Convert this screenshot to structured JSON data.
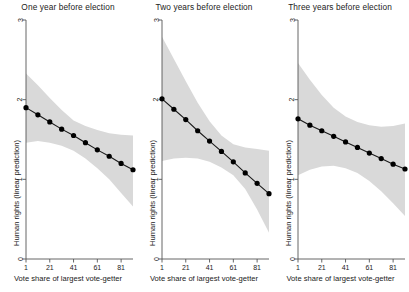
{
  "figure": {
    "background": "#ffffff",
    "axis_color": "#555555",
    "band_color": "#d9d9d9",
    "line_color": "#1a1a1a",
    "marker_color": "#000000"
  },
  "axes": {
    "y_label": "Human rights (linear prediction)",
    "x_label": "Vote share of largest vote-getter",
    "y_ticks": [
      "0",
      "1",
      "2",
      "3"
    ],
    "x_ticks": [
      "1",
      "21",
      "41",
      "61",
      "81"
    ]
  },
  "chart_data": [
    {
      "type": "line",
      "title": "One year before election",
      "xlabel": "Vote share of largest vote-getter",
      "ylabel": "Human rights (linear prediction)",
      "xlim": [
        1,
        91
      ],
      "ylim": [
        0,
        3
      ],
      "x_ticks": [
        1,
        21,
        41,
        61,
        81
      ],
      "y_ticks": [
        0,
        1,
        2,
        3
      ],
      "grid": false,
      "legend": "none",
      "x": [
        1,
        11,
        21,
        31,
        41,
        51,
        61,
        71,
        81,
        91
      ],
      "values": [
        1.9,
        1.81,
        1.72,
        1.63,
        1.55,
        1.46,
        1.37,
        1.29,
        1.2,
        1.12
      ],
      "ci_lower": [
        1.46,
        1.48,
        1.46,
        1.42,
        1.36,
        1.26,
        1.14,
        1.0,
        0.83,
        0.66
      ],
      "ci_upper": [
        2.33,
        2.18,
        2.02,
        1.87,
        1.74,
        1.67,
        1.62,
        1.58,
        1.56,
        1.55
      ],
      "marker": "filled-circle",
      "band_label": "95% confidence interval"
    },
    {
      "type": "line",
      "title": "Two years before election",
      "xlabel": "Vote share of largest vote-getter",
      "ylabel": "Human rights (linear prediction)",
      "xlim": [
        1,
        91
      ],
      "ylim": [
        0,
        3
      ],
      "x_ticks": [
        1,
        21,
        41,
        61,
        81
      ],
      "y_ticks": [
        0,
        1,
        2,
        3
      ],
      "grid": false,
      "legend": "none",
      "x": [
        1,
        11,
        21,
        31,
        41,
        51,
        61,
        71,
        81,
        91
      ],
      "values": [
        2.01,
        1.88,
        1.75,
        1.61,
        1.48,
        1.35,
        1.22,
        1.08,
        0.95,
        0.82
      ],
      "ci_lower": [
        1.23,
        1.26,
        1.27,
        1.26,
        1.22,
        1.15,
        1.05,
        0.88,
        0.62,
        0.33
      ],
      "ci_upper": [
        2.79,
        2.51,
        2.23,
        1.96,
        1.73,
        1.55,
        1.44,
        1.4,
        1.38,
        1.36
      ],
      "marker": "filled-circle",
      "band_label": "95% confidence interval"
    },
    {
      "type": "line",
      "title": "Three years before election",
      "xlabel": "Vote share of largest vote-getter",
      "ylabel": "Human rights (linear prediction)",
      "xlim": [
        1,
        91
      ],
      "ylim": [
        0,
        3
      ],
      "x_ticks": [
        1,
        21,
        41,
        61,
        81
      ],
      "y_ticks": [
        0,
        1,
        2,
        3
      ],
      "grid": false,
      "legend": "none",
      "x": [
        1,
        11,
        21,
        31,
        41,
        51,
        61,
        71,
        81,
        91
      ],
      "values": [
        1.76,
        1.68,
        1.61,
        1.54,
        1.47,
        1.4,
        1.33,
        1.26,
        1.19,
        1.13
      ],
      "ci_lower": [
        1.05,
        1.12,
        1.16,
        1.17,
        1.14,
        1.08,
        0.98,
        0.85,
        0.7,
        0.54
      ],
      "ci_upper": [
        2.46,
        2.25,
        2.06,
        1.9,
        1.79,
        1.72,
        1.68,
        1.66,
        1.67,
        1.7
      ],
      "marker": "filled-circle",
      "band_label": "95% confidence interval"
    }
  ]
}
